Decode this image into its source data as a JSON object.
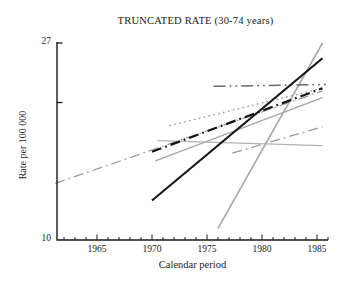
{
  "figure": {
    "title": "TRUNCATED RATE (30-74 years)"
  },
  "chart_data": {
    "type": "line",
    "title": "TRUNCATED RATE (30-74 years)",
    "xlabel": "Calendar period",
    "ylabel": "Rate per 100 000",
    "xlim": [
      1961,
      1986
    ],
    "ylim": [
      10,
      27
    ],
    "y_scale": "log",
    "x_ticks_labeled": [
      1965,
      1970,
      1975,
      1980,
      1985
    ],
    "x_minor_tick_step": 1,
    "y_ticks_labeled": [
      27,
      10
    ],
    "y_ticks_unlabeled": [
      20
    ],
    "grid": false,
    "legend": false,
    "axis_color": "#1a1a1a",
    "series": [
      {
        "name": "gray long dash-dot trend",
        "line_style": "dashdot",
        "color": "#9b9b9b",
        "width": 1.3,
        "x": [
          1961.2,
          1985.5
        ],
        "values": [
          13.3,
          21.2
        ]
      },
      {
        "name": "gray dotted trend",
        "line_style": "dotted",
        "color": "#999999",
        "width": 1.4,
        "x": [
          1971.6,
          1985.5
        ],
        "values": [
          17.8,
          21.5
        ]
      },
      {
        "name": "gray mid solid trend",
        "line_style": "solid",
        "color": "#a6a6a6",
        "width": 1.3,
        "x": [
          1970.3,
          1985.5
        ],
        "values": [
          14.9,
          20.5
        ]
      },
      {
        "name": "gray flat solid trend",
        "line_style": "solid",
        "color": "#b3b3b3",
        "width": 1.2,
        "x": [
          1970.5,
          1985.5
        ],
        "values": [
          16.5,
          16.1
        ]
      },
      {
        "name": "gray low dash-dot trend",
        "line_style": "dashdot",
        "color": "#9b9b9b",
        "width": 1.3,
        "x": [
          1977.3,
          1985.5
        ],
        "values": [
          15.5,
          17.7
        ]
      },
      {
        "name": "gray steep solid trend",
        "line_style": "solid",
        "color": "#ababab",
        "width": 1.7,
        "x": [
          1976.0,
          1985.5
        ],
        "values": [
          10.6,
          27.0
        ]
      },
      {
        "name": "flat dash-dot-dot trend",
        "line_style": "dashdotdot",
        "color": "#6b6b6b",
        "width": 1.5,
        "x": [
          1975.6,
          1985.8
        ],
        "values": [
          21.7,
          21.9
        ]
      },
      {
        "name": "black dash-dot trend",
        "line_style": "dashdot",
        "color": "#161616",
        "width": 2.2,
        "x": [
          1970.0,
          1985.5
        ],
        "values": [
          15.6,
          21.5
        ]
      },
      {
        "name": "black solid trend",
        "line_style": "solid",
        "color": "#161616",
        "width": 2.1,
        "x": [
          1970.0,
          1985.5
        ],
        "values": [
          12.2,
          25.0
        ]
      }
    ]
  }
}
